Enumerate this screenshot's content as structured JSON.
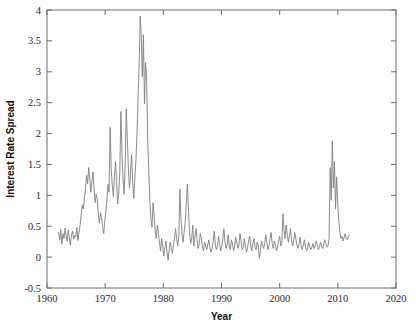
{
  "chart_data": {
    "type": "line",
    "title": "",
    "subtitle": "",
    "xlabel": "Year",
    "ylabel": "Interest Rate Spread",
    "xlim": [
      1960,
      2020
    ],
    "ylim": [
      -0.5,
      4
    ],
    "xticks": [
      1960,
      1970,
      1980,
      1990,
      2000,
      2010,
      2020
    ],
    "xtick_labels": [
      "1960",
      "1970",
      "1980",
      "1990",
      "2000",
      "2010",
      "2020"
    ],
    "yticks": [
      -0.5,
      0,
      0.5,
      1,
      1.5,
      2,
      2.5,
      3,
      3.5,
      4
    ],
    "ytick_labels": [
      "-0.5",
      "0",
      "0.5",
      "1",
      "1.5",
      "2",
      "2.5",
      "3",
      "3.5",
      "4"
    ],
    "grid": false,
    "legend": null,
    "series": [
      {
        "name": "Interest Rate Spread",
        "color": "#808080",
        "x_start": 1962.0,
        "x_end": 2012.0,
        "x_step": 0.25,
        "values": [
          0.4,
          0.28,
          0.45,
          0.21,
          0.38,
          0.3,
          0.47,
          0.34,
          0.26,
          0.44,
          0.31,
          0.19,
          0.36,
          0.42,
          0.29,
          0.35,
          0.33,
          0.48,
          0.27,
          0.4,
          0.52,
          0.68,
          0.84,
          0.78,
          0.95,
          1.1,
          1.32,
          1.19,
          1.45,
          1.28,
          1.05,
          1.22,
          1.38,
          1.12,
          0.88,
          1.02,
          0.93,
          0.7,
          0.55,
          0.72,
          0.64,
          0.48,
          0.38,
          0.58,
          0.74,
          0.92,
          1.18,
          1.05,
          2.1,
          1.42,
          1.16,
          0.98,
          1.3,
          1.55,
          1.22,
          0.86,
          1.04,
          1.36,
          2.36,
          1.7,
          1.28,
          1.02,
          1.48,
          2.4,
          1.92,
          1.44,
          1.12,
          1.38,
          1.66,
          1.2,
          0.95,
          1.28,
          1.56,
          2.0,
          2.55,
          3.1,
          3.9,
          3.58,
          2.92,
          3.6,
          2.48,
          3.15,
          2.9,
          1.88,
          1.4,
          0.92,
          0.62,
          0.48,
          0.88,
          0.66,
          0.42,
          0.3,
          0.52,
          0.38,
          0.22,
          0.1,
          0.3,
          0.18,
          0.02,
          0.15,
          0.26,
          0.08,
          -0.05,
          0.12,
          0.24,
          0.14,
          0.06,
          0.2,
          0.32,
          0.46,
          0.28,
          0.18,
          0.35,
          1.1,
          0.62,
          0.36,
          0.24,
          0.42,
          0.58,
          0.88,
          1.18,
          0.74,
          0.4,
          0.22,
          0.3,
          0.52,
          0.18,
          0.34,
          0.46,
          0.28,
          0.14,
          0.22,
          0.38,
          0.3,
          0.16,
          0.1,
          0.24,
          0.18,
          0.12,
          0.2,
          0.28,
          0.15,
          0.08,
          0.14,
          0.26,
          0.42,
          0.2,
          0.12,
          0.18,
          0.34,
          0.22,
          0.1,
          0.16,
          0.3,
          0.46,
          0.24,
          0.14,
          0.2,
          0.36,
          0.18,
          0.12,
          0.28,
          0.22,
          0.1,
          0.18,
          0.32,
          0.24,
          0.14,
          0.2,
          0.38,
          0.26,
          0.12,
          0.16,
          0.3,
          0.2,
          0.08,
          0.14,
          0.26,
          0.34,
          0.18,
          0.1,
          0.22,
          0.3,
          0.16,
          0.12,
          0.24,
          0.18,
          -0.02,
          0.1,
          0.26,
          0.2,
          0.14,
          0.22,
          0.36,
          0.24,
          0.12,
          0.18,
          0.3,
          0.4,
          0.22,
          0.14,
          0.26,
          0.2,
          0.1,
          0.16,
          0.28,
          0.34,
          0.18,
          0.22,
          0.7,
          0.44,
          0.3,
          0.52,
          0.38,
          0.24,
          0.34,
          0.46,
          0.28,
          0.18,
          0.26,
          0.4,
          0.3,
          0.2,
          0.14,
          0.22,
          0.32,
          0.18,
          0.12,
          0.2,
          0.28,
          0.16,
          0.1,
          0.14,
          0.24,
          0.18,
          0.12,
          0.16,
          0.22,
          0.14,
          0.18,
          0.26,
          0.2,
          0.12,
          0.16,
          0.24,
          0.18,
          0.14,
          0.2,
          0.28,
          0.22,
          0.16,
          0.18,
          0.3,
          1.45,
          0.92,
          1.88,
          1.12,
          1.55,
          0.78,
          1.3,
          0.88,
          0.6,
          0.42,
          0.3,
          0.34,
          0.26,
          0.32,
          0.38,
          0.3,
          0.28,
          0.34,
          0.36
        ]
      }
    ],
    "annotations": [],
    "peak_note_1974": 3.9,
    "peak_note_2008": 1.9
  },
  "axis": {
    "x_title": "Year",
    "y_title": "Interest Rate Spread"
  }
}
